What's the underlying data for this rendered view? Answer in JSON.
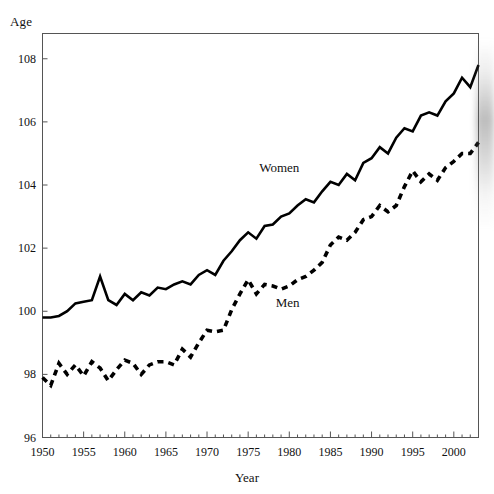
{
  "chart_data": {
    "type": "line",
    "title": "",
    "xlabel": "Year",
    "ylabel": "Age",
    "xlim": [
      1950,
      2003
    ],
    "ylim": [
      96,
      108.8
    ],
    "grid": false,
    "legend_position": "inline-annotations",
    "xticks": [
      1950,
      1955,
      1960,
      1965,
      1970,
      1975,
      1980,
      1985,
      1990,
      1995,
      2000
    ],
    "yticks": [
      96,
      98,
      100,
      102,
      104,
      106,
      108
    ],
    "x": [
      1950,
      1951,
      1952,
      1953,
      1954,
      1955,
      1956,
      1957,
      1958,
      1959,
      1960,
      1961,
      1962,
      1963,
      1964,
      1965,
      1966,
      1967,
      1968,
      1969,
      1970,
      1971,
      1972,
      1973,
      1974,
      1975,
      1976,
      1977,
      1978,
      1979,
      1980,
      1981,
      1982,
      1983,
      1984,
      1985,
      1986,
      1987,
      1988,
      1989,
      1990,
      1991,
      1992,
      1993,
      1994,
      1995,
      1996,
      1997,
      1998,
      1999,
      2000,
      2001,
      2002,
      2003
    ],
    "series": [
      {
        "name": "Women",
        "style": "solid",
        "color": "#000000",
        "label_x": 1979.5,
        "label_y": 104.55,
        "values": [
          99.8,
          99.8,
          99.85,
          100.0,
          100.25,
          100.3,
          100.35,
          101.1,
          100.35,
          100.2,
          100.55,
          100.35,
          100.6,
          100.5,
          100.75,
          100.7,
          100.85,
          100.95,
          100.85,
          101.15,
          101.3,
          101.15,
          101.6,
          101.9,
          102.25,
          102.5,
          102.3,
          102.7,
          102.75,
          103.0,
          103.1,
          103.35,
          103.55,
          103.45,
          103.8,
          104.1,
          104.0,
          104.35,
          104.15,
          104.7,
          104.85,
          105.2,
          105.0,
          105.5,
          105.8,
          105.7,
          106.2,
          106.3,
          106.2,
          106.65,
          106.9,
          107.4,
          107.1,
          107.8
        ]
      },
      {
        "name": "Men",
        "style": "dashed",
        "color": "#000000",
        "label_x": 1981.5,
        "label_y": 100.25,
        "values": [
          97.9,
          97.65,
          98.35,
          98.0,
          98.3,
          97.95,
          98.4,
          98.2,
          97.8,
          98.15,
          98.45,
          98.35,
          98.0,
          98.3,
          98.4,
          98.4,
          98.3,
          98.8,
          98.55,
          99.0,
          99.4,
          99.35,
          99.4,
          100.05,
          100.55,
          101.0,
          100.55,
          100.85,
          100.8,
          100.7,
          100.8,
          101.0,
          101.1,
          101.3,
          101.55,
          102.1,
          102.35,
          102.25,
          102.5,
          102.9,
          103.0,
          103.35,
          103.15,
          103.35,
          103.95,
          104.45,
          104.1,
          104.35,
          104.15,
          104.55,
          104.75,
          105.0,
          105.0,
          105.35
        ]
      }
    ]
  },
  "axes": {
    "y_title": "Age",
    "x_title": "Year",
    "ytick_labels": [
      "108",
      "106",
      "104",
      "102",
      "100",
      "98",
      "96"
    ],
    "xtick_labels": [
      "1950",
      "1955",
      "1960",
      "1965",
      "1970",
      "1975",
      "1980",
      "1985",
      "1990",
      "1995",
      "2000"
    ]
  },
  "annotations": {
    "women_label": "Women",
    "men_label": "Men"
  },
  "colors": {
    "line": "#000000",
    "frame": "#555555",
    "text": "#111111",
    "background": "#ffffff"
  }
}
